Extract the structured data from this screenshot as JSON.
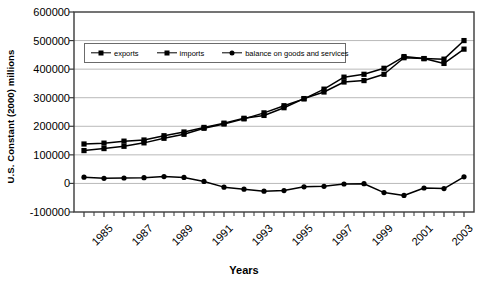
{
  "chart_data": {
    "type": "line",
    "title": "",
    "xlabel": "Years",
    "ylabel": "U.S. Constant (2000) millions",
    "xlim": [
      1983.5,
      2003.5
    ],
    "ylim": [
      -100000,
      600000
    ],
    "ytick_labels": [
      "600000",
      "500000",
      "400000",
      "300000",
      "200000",
      "100000",
      "0",
      "-100000"
    ],
    "ytick_values": [
      600000,
      500000,
      400000,
      300000,
      200000,
      100000,
      0,
      -100000
    ],
    "xtick_labels": [
      "1985",
      "1987",
      "1989",
      "1991",
      "1993",
      "1995",
      "1997",
      "1999",
      "2001",
      "2003"
    ],
    "xtick_values": [
      1985,
      1987,
      1989,
      1991,
      1993,
      1995,
      1997,
      1999,
      2001,
      2003
    ],
    "grid": "horizontal",
    "legend_position": "top-left-inside",
    "x": [
      1984,
      1985,
      1986,
      1987,
      1988,
      1989,
      1990,
      1991,
      1992,
      1993,
      1994,
      1995,
      1996,
      1997,
      1998,
      1999,
      2000,
      2001,
      2002,
      2003
    ],
    "series": [
      {
        "name": "exports",
        "marker": "square",
        "values": [
          138000,
          141000,
          148000,
          152000,
          167000,
          180000,
          196000,
          211000,
          228000,
          238000,
          265000,
          297000,
          320000,
          355000,
          360000,
          382000,
          440000,
          437000,
          435000,
          500000
        ]
      },
      {
        "name": "imports",
        "marker": "square",
        "values": [
          115000,
          122000,
          130000,
          142000,
          158000,
          172000,
          193000,
          208000,
          226000,
          247000,
          272000,
          296000,
          330000,
          372000,
          382000,
          403000,
          444000,
          437000,
          420000,
          470000
        ]
      },
      {
        "name": "balance on goods and services",
        "marker": "circle",
        "values": [
          22000,
          18000,
          19000,
          20000,
          24000,
          21000,
          7000,
          -13000,
          -20000,
          -27000,
          -25000,
          -12000,
          -10000,
          -2000,
          -1000,
          -32000,
          -42000,
          -16000,
          -18000,
          23000
        ]
      }
    ]
  },
  "legend": {
    "items": [
      {
        "label": "exports"
      },
      {
        "label": "imports"
      },
      {
        "label": "balance on goods and services"
      }
    ]
  }
}
